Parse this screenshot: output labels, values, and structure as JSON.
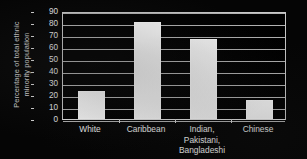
{
  "chart_data": {
    "type": "bar",
    "title": "",
    "xlabel": "",
    "ylabel": "Percentage of total ethnic minority population",
    "ylabel_lines": [
      "Percentage of total ethnic",
      "minority population"
    ],
    "categories": [
      "White",
      "Caribbean",
      "Indian, Pakistani, Bangladeshi",
      "Chinese"
    ],
    "category_lines": [
      [
        "White"
      ],
      [
        "Caribbean"
      ],
      [
        "Indian,",
        "Pakistani,",
        "Bangladeshi"
      ],
      [
        "Chinese"
      ]
    ],
    "values": [
      23,
      81,
      67,
      16
    ],
    "ylim": [
      0,
      90
    ],
    "yticks": [
      0,
      10,
      20,
      30,
      40,
      50,
      60,
      70,
      80,
      90
    ],
    "ytick_labels": [
      "0",
      "10",
      "20",
      "30",
      "40",
      "50",
      "60",
      "70",
      "80",
      "90"
    ],
    "grid": true,
    "legend": "none",
    "colors": {
      "background": "#000000",
      "bar_fill": "#fbfbfb",
      "gridline": "#b4b4b4",
      "axis": "#c9c9c9",
      "text": "#ededed"
    }
  }
}
